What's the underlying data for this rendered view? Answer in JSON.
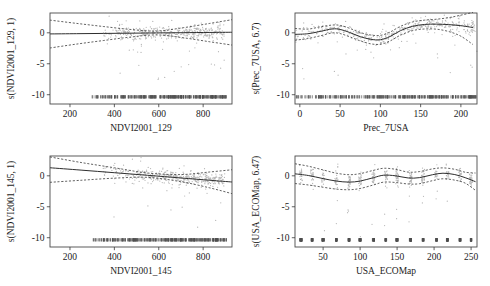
{
  "figure": {
    "type": "multi-panel-gam-partial-effect-plots",
    "rows": 2,
    "cols": 2,
    "background": "#ffffff",
    "point_color": "#b4b4b4",
    "line_color": "#2e2e2e"
  },
  "chart_data": [
    {
      "type": "line",
      "panel": "top-left",
      "title": "",
      "xlabel": "NDVI2001_129",
      "ylabel": "s(NDVI2001_129, 1)",
      "edf": "1",
      "xlim": [
        110,
        930
      ],
      "ylim": [
        -11.5,
        3.2
      ],
      "xticks": [
        200,
        400,
        600,
        800
      ],
      "yticks": [
        0,
        -5,
        -10
      ],
      "ytick_labels": [
        "0",
        "-5",
        "-10"
      ],
      "grid": false,
      "legend": "none",
      "fit": {
        "x": [
          110,
          230,
          350,
          470,
          590,
          710,
          830,
          930
        ],
        "y": [
          -0.18,
          -0.14,
          -0.1,
          -0.06,
          -0.02,
          0.02,
          0.06,
          0.09
        ]
      },
      "ci_upper": {
        "x": [
          110,
          230,
          350,
          470,
          590,
          710,
          830,
          930
        ],
        "y": [
          2.05,
          1.52,
          1.02,
          0.55,
          0.28,
          0.82,
          1.52,
          2.12
        ]
      },
      "ci_lower": {
        "x": [
          110,
          230,
          350,
          470,
          590,
          710,
          830,
          930
        ],
        "y": [
          -2.45,
          -1.82,
          -1.25,
          -0.7,
          -0.34,
          -0.8,
          -1.45,
          -1.98
        ]
      },
      "rug": true,
      "rug_y": -10.6,
      "n_points": 430
    },
    {
      "type": "line",
      "panel": "top-right",
      "title": "",
      "xlabel": "Prec_7USA",
      "ylabel": "s(Prec_7USA, 6.7)",
      "edf": "6.7",
      "xlim": [
        -6,
        220
      ],
      "ylim": [
        -11.5,
        3.2
      ],
      "xticks": [
        0,
        50,
        100,
        150,
        200
      ],
      "yticks": [
        0,
        -5,
        -10
      ],
      "ytick_labels": [
        "0",
        "-5",
        "-10"
      ],
      "grid": false,
      "legend": "none",
      "fit": {
        "x": [
          -6,
          10,
          25,
          40,
          50,
          62,
          75,
          88,
          100,
          112,
          125,
          140,
          155,
          170,
          185,
          200,
          215
        ],
        "y": [
          -0.25,
          -0.15,
          0.22,
          0.62,
          0.55,
          0.05,
          -0.62,
          -1.05,
          -1.12,
          -0.6,
          0.35,
          1.05,
          1.35,
          1.4,
          1.32,
          1.15,
          0.85
        ]
      },
      "ci_upper": {
        "x": [
          -6,
          10,
          25,
          40,
          50,
          62,
          75,
          88,
          100,
          112,
          125,
          140,
          155,
          170,
          185,
          200,
          215
        ],
        "y": [
          0.7,
          0.6,
          0.95,
          1.25,
          1.2,
          0.72,
          0.05,
          -0.35,
          -0.42,
          0.12,
          1.05,
          1.75,
          2.05,
          2.2,
          2.45,
          2.85,
          3.3
        ]
      },
      "ci_lower": {
        "x": [
          -6,
          10,
          25,
          40,
          50,
          62,
          75,
          88,
          100,
          112,
          125,
          140,
          155,
          170,
          185,
          200,
          215
        ],
        "y": [
          -1.2,
          -0.92,
          -0.5,
          -0.02,
          -0.12,
          -0.65,
          -1.3,
          -1.78,
          -1.85,
          -1.32,
          -0.38,
          0.35,
          0.62,
          0.58,
          0.2,
          -0.55,
          -1.9
        ]
      },
      "rug": true,
      "rug_y": -10.6,
      "n_points": 430
    },
    {
      "type": "line",
      "panel": "bottom-left",
      "title": "",
      "xlabel": "NDVI2001_145",
      "ylabel": "s(NDVI2001_145, 1)",
      "edf": "1",
      "xlim": [
        110,
        930
      ],
      "ylim": [
        -11.5,
        3.2
      ],
      "xticks": [
        200,
        400,
        600,
        800
      ],
      "yticks": [
        0,
        -5,
        -10
      ],
      "ytick_labels": [
        "0",
        "-5",
        "-10"
      ],
      "grid": false,
      "legend": "none",
      "fit": {
        "x": [
          110,
          250,
          400,
          550,
          700,
          830,
          930
        ],
        "y": [
          1.3,
          0.92,
          0.5,
          0.08,
          -0.35,
          -0.72,
          -1.0
        ]
      },
      "ci_upper": {
        "x": [
          110,
          250,
          400,
          550,
          700,
          830,
          930
        ],
        "y": [
          3.05,
          2.15,
          1.3,
          0.45,
          0.2,
          0.62,
          0.98
        ]
      },
      "ci_lower": {
        "x": [
          110,
          250,
          400,
          550,
          700,
          830,
          930
        ],
        "y": [
          -1.05,
          -0.72,
          -0.38,
          -0.25,
          -0.95,
          -1.95,
          -2.88
        ]
      },
      "rug": true,
      "rug_y": -10.6,
      "n_points": 430
    },
    {
      "type": "line",
      "panel": "bottom-right",
      "title": "",
      "xlabel": "USA_ECOMap",
      "ylabel": "s(USA_ECOMap, 6.47)",
      "edf": "6.47",
      "xlim": [
        12,
        258
      ],
      "ylim": [
        -11.5,
        3.2
      ],
      "xticks": [
        50,
        100,
        150,
        200,
        250
      ],
      "yticks": [
        0,
        -5,
        -10
      ],
      "ytick_labels": [
        "0",
        "-5",
        "-10"
      ],
      "grid": false,
      "legend": "none",
      "fit": {
        "x": [
          12,
          30,
          50,
          68,
          85,
          100,
          118,
          132,
          148,
          165,
          180,
          198,
          212,
          228,
          242,
          256
        ],
        "y": [
          0.32,
          0.05,
          -0.45,
          -0.85,
          -1.02,
          -0.85,
          -0.3,
          0.1,
          0.0,
          -0.35,
          -0.3,
          0.18,
          0.42,
          0.2,
          -0.3,
          -0.95
        ]
      },
      "ci_upper": {
        "x": [
          12,
          30,
          50,
          68,
          85,
          100,
          118,
          132,
          148,
          165,
          180,
          198,
          212,
          228,
          242,
          256
        ],
        "y": [
          1.95,
          1.55,
          0.95,
          0.42,
          0.18,
          0.35,
          0.88,
          1.22,
          1.05,
          0.6,
          0.68,
          1.12,
          1.28,
          1.05,
          0.58,
          0.45
        ]
      },
      "ci_lower": {
        "x": [
          12,
          30,
          50,
          68,
          85,
          100,
          118,
          132,
          148,
          165,
          180,
          198,
          212,
          228,
          242,
          256
        ],
        "y": [
          -1.25,
          -1.48,
          -1.85,
          -2.15,
          -2.25,
          -2.05,
          -1.48,
          -1.02,
          -1.08,
          -1.32,
          -1.28,
          -0.78,
          -0.48,
          -0.7,
          -1.18,
          -2.35
        ]
      },
      "rug": true,
      "rug_y": -10.6,
      "n_points": 430
    }
  ]
}
